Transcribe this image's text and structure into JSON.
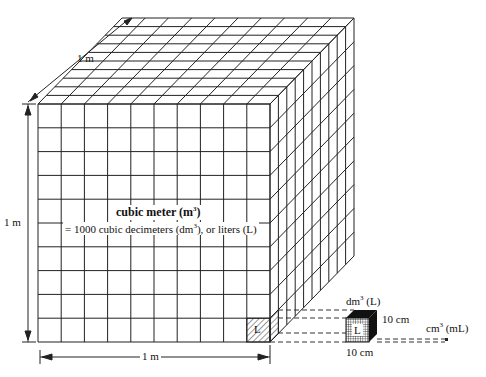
{
  "diagram": {
    "type": "unit-volume-cube",
    "grid_divisions": 10,
    "labels": {
      "depth_dim": "1 m",
      "height_dim": "1 m",
      "width_dim": "1 m",
      "title_main": "cubic meter (m",
      "title_sup": "3",
      "title_close": ")",
      "subtitle_pre": "= 1000 cubic decimeters (dm",
      "subtitle_sup": "3",
      "subtitle_post": "), or liters (L)",
      "liter_cell": "L",
      "dm_label_pre": "dm",
      "dm_label_sup": "3",
      "dm_label_post": " (L)",
      "small_cube_cell": "L",
      "side_dim": "10 cm",
      "bottom_dim": "10 cm",
      "cm_label_pre": "cm",
      "cm_label_sup": "3",
      "cm_label_post": " (mL)"
    },
    "colors": {
      "line": "#222222",
      "background": "#ffffff",
      "dark_face": "#111111"
    }
  }
}
